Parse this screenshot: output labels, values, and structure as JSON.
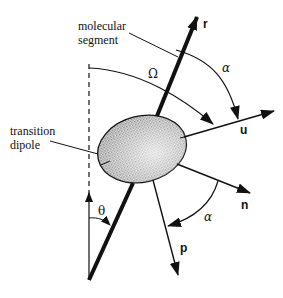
{
  "diagram": {
    "labels": {
      "molecular_segment_line1": "molecular",
      "molecular_segment_line2": "segment",
      "transition_dipole_line1": "transition",
      "transition_dipole_line2": "dipole",
      "omega": "Ω",
      "alpha_top": "α",
      "alpha_bottom": "α",
      "theta": "θ"
    },
    "vectors": {
      "r": "r",
      "u": "u",
      "n": "n",
      "p": "p"
    },
    "colors": {
      "stroke": "#111111",
      "ellipse_fill": "#c8c8c8",
      "background": "#ffffff"
    }
  }
}
